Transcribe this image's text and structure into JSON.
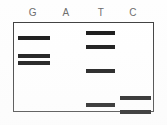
{
  "figure": {
    "kind": "dna-sequencing-gel",
    "background_color": "#ffffff",
    "frame_color": "#3a3a3a",
    "band_color": "#101010",
    "label_color": "#6b6b6b"
  },
  "lanes": [
    {
      "id": "lane-g",
      "label": "G",
      "label_x": 26,
      "lane_x": 17,
      "lane_width": 32,
      "band_count": 3
    },
    {
      "id": "lane-a",
      "label": "A",
      "label_x": 59,
      "lane_x": 52,
      "lane_width": 30,
      "band_count": 0
    },
    {
      "id": "lane-t",
      "label": "T",
      "label_x": 94,
      "lane_x": 85,
      "lane_width": 29,
      "band_count": 4
    },
    {
      "id": "lane-c",
      "label": "C",
      "label_x": 126,
      "lane_x": 119,
      "lane_width": 31,
      "band_count": 2
    }
  ],
  "chart_data": {
    "type": "scatter",
    "title": "",
    "xlabel": "",
    "ylabel": "",
    "categories": [
      "G",
      "A",
      "T",
      "C"
    ],
    "grid": false,
    "legend": "none",
    "series": [
      {
        "name": "G",
        "bands": [
          {
            "y": 35,
            "x": 17,
            "width": 32,
            "height": 4
          },
          {
            "y": 53,
            "x": 17,
            "width": 32,
            "height": 4
          },
          {
            "y": 60,
            "x": 17,
            "width": 32,
            "height": 4
          }
        ]
      },
      {
        "name": "A",
        "bands": []
      },
      {
        "name": "T",
        "bands": [
          {
            "y": 30,
            "x": 85,
            "width": 29,
            "height": 4
          },
          {
            "y": 44,
            "x": 85,
            "width": 29,
            "height": 4
          },
          {
            "y": 68,
            "x": 85,
            "width": 29,
            "height": 4
          },
          {
            "y": 102,
            "x": 85,
            "width": 29,
            "height": 4
          }
        ]
      },
      {
        "name": "C",
        "bands": [
          {
            "y": 95,
            "x": 119,
            "width": 31,
            "height": 4
          },
          {
            "y": 109,
            "x": 119,
            "width": 31,
            "height": 4
          }
        ]
      }
    ]
  }
}
